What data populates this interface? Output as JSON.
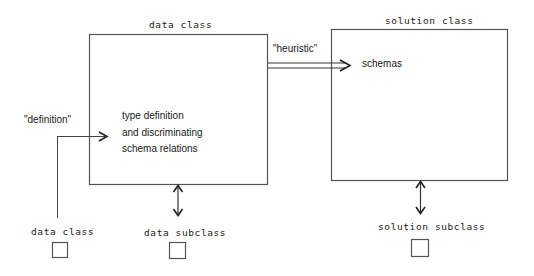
{
  "diagram": {
    "data_box": {
      "title": "data class",
      "lines": [
        "type definition",
        "and discriminating",
        "schema relations"
      ]
    },
    "solution_box": {
      "title": "solution class",
      "content": "schemas"
    },
    "edges": {
      "definition_label": "\"definition\"",
      "heuristic_label": "\"heuristic\""
    },
    "nodes": {
      "data_class_label": "data class",
      "data_subclass_label": "data subclass",
      "solution_subclass_label": "solution subclass"
    },
    "colors": {
      "stroke": "#444444",
      "text": "#1a1a1a",
      "background": "#ffffff"
    }
  }
}
